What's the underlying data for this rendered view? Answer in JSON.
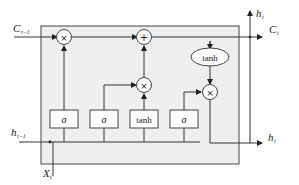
{
  "diagram": {
    "colors": {
      "cell_fill": "#efefef",
      "stroke": "#333333",
      "node_fill": "#ffffff"
    },
    "inputs": {
      "cell_state_prev": {
        "main": "C",
        "sub": "t−1"
      },
      "hidden_prev": {
        "main": "h",
        "sub": "t−1"
      },
      "x": {
        "main": "X",
        "sub": "t"
      }
    },
    "outputs": {
      "cell_state": {
        "main": "C",
        "sub": "t"
      },
      "hidden_top": {
        "main": "h",
        "sub": "t"
      },
      "hidden_right": {
        "main": "h",
        "sub": "t"
      }
    },
    "operators": {
      "forget_multiply": "×",
      "cell_add": "+",
      "input_multiply": "×",
      "output_multiply": "×"
    },
    "gates": [
      {
        "name": "forget-gate",
        "label": "σ"
      },
      {
        "name": "input-gate",
        "label": "σ"
      },
      {
        "name": "candidate",
        "label": "tanh"
      },
      {
        "name": "output-gate",
        "label": "σ"
      }
    ],
    "cell_tanh": "tanh"
  }
}
